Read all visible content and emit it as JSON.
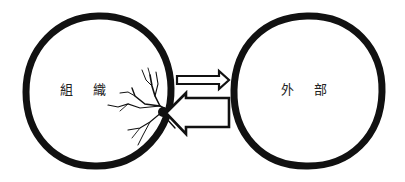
{
  "diagram": {
    "type": "two-circle-interaction",
    "colors": {
      "stroke": "#111111",
      "background": "#ffffff",
      "text": "#222222"
    },
    "left_circle": {
      "label": "組 織",
      "state": "cracked"
    },
    "right_circle": {
      "label": "外 部"
    },
    "arrows": [
      {
        "direction": "right",
        "from": "組織",
        "to": "外部",
        "weight": "thin"
      },
      {
        "direction": "left",
        "from": "外部",
        "to": "組織",
        "weight": "thick"
      }
    ]
  }
}
